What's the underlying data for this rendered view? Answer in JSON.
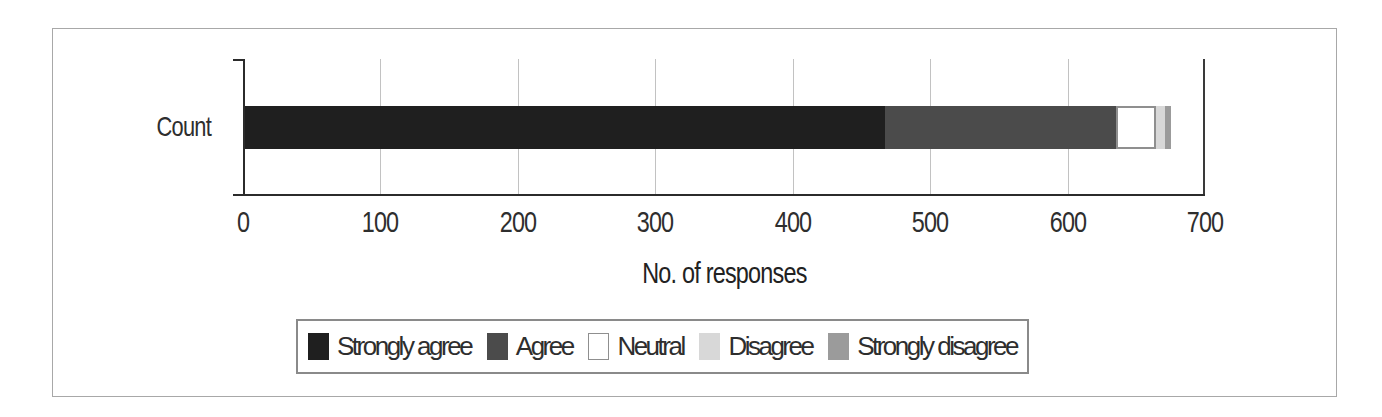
{
  "figure": {
    "category_label": "Count",
    "x_axis_title": "No. of responses"
  },
  "chart_data": {
    "type": "bar",
    "orientation": "horizontal",
    "stacked": true,
    "title": "",
    "categories": [
      "Count"
    ],
    "series": [
      {
        "name": "Strongly agree",
        "values": [
          467
        ],
        "color": "#1f1f1f"
      },
      {
        "name": "Agree",
        "values": [
          168
        ],
        "color": "#4b4b4b"
      },
      {
        "name": "Neutral",
        "values": [
          29
        ],
        "color": "#ffffff",
        "border": "#8f8f8f"
      },
      {
        "name": "Disagree",
        "values": [
          7
        ],
        "color": "#d8d8d8"
      },
      {
        "name": "Strongly disagree",
        "values": [
          4
        ],
        "color": "#9b9b9b"
      }
    ],
    "xlabel": "No. of responses",
    "ylabel": "",
    "xlim": [
      0,
      700
    ],
    "x_ticks": [
      0,
      100,
      200,
      300,
      400,
      500,
      600,
      700
    ],
    "grid": true,
    "legend_position": "bottom",
    "total": 675
  },
  "colors": {
    "axis": "#2b2b2b",
    "gridline": "#c2c2c2",
    "figure_border": "#a8a8a8",
    "legend_border": "#8a8a8a",
    "text": "#2e2e2e"
  }
}
